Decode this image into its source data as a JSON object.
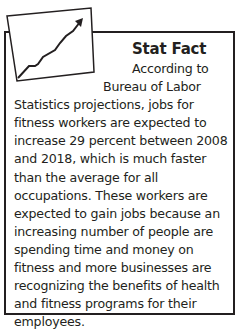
{
  "sidebar_box": {
    "title": "Stat Fact",
    "icon": "rising-line-chart-icon",
    "lines": [
      "According to",
      "Bureau of Labor",
      "Statistics projections, jobs for fitness workers are expected to increase 29 percent between 2008 and 2018, which is much faster than the average for all occupations. These workers are expected to gain jobs because an increasing number of people are spending time and money on fitness and more businesses are recognizing the benefits of health and fitness programs for their employees."
    ]
  },
  "colors": {
    "ink": "#231f20",
    "background": "#ffffff"
  }
}
